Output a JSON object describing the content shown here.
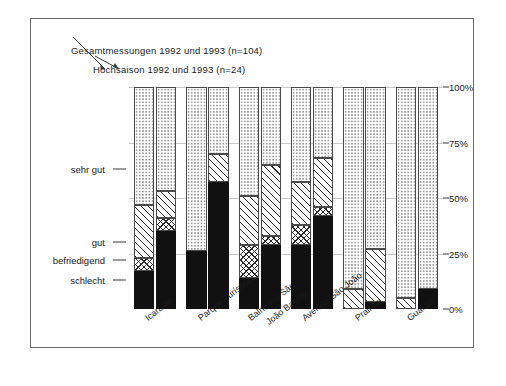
{
  "legend": {
    "total": "Gesamtmessungen 1992 und 1993 (n=104)",
    "high_season": "Hochsaison 1992 und 1993 (n=24)"
  },
  "left_keys": [
    {
      "label": "sehr gut",
      "pct": 63
    },
    {
      "label": "gut",
      "pct": 30
    },
    {
      "label": "befriedigend",
      "pct": 22
    },
    {
      "label": "schlecht",
      "pct": 13
    }
  ],
  "right_axis": [
    "0%",
    "25%",
    "50%",
    "75%",
    "100%"
  ],
  "chart_data": {
    "type": "bar",
    "title": "",
    "xlabel": "",
    "ylabel": "",
    "ylim": [
      0,
      100
    ],
    "grid": true,
    "stacked": true,
    "grouped": true,
    "legend_position": "top-left",
    "categories": [
      "Icaraíba",
      "Parque Turístico",
      "Balneário São João Batista",
      "Avenida São João",
      "Prainha",
      "Guaraú"
    ],
    "groups": [
      "Gesamtmessungen 1992 und 1993 (n=104)",
      "Hochsaison 1992 und 1993 (n=24)"
    ],
    "stack_order": [
      "schlecht",
      "befriedigend",
      "gut",
      "sehr gut"
    ],
    "series": [
      {
        "name": "schlecht",
        "pattern": "solid-black",
        "values_total": [
          17,
          26,
          14,
          29,
          0,
          0
        ],
        "values_high": [
          35,
          57,
          29,
          42,
          3,
          9
        ]
      },
      {
        "name": "befriedigend",
        "pattern": "cross-hatch",
        "values_total": [
          6,
          0,
          15,
          9,
          0,
          0
        ],
        "values_high": [
          6,
          0,
          4,
          4,
          0,
          0
        ]
      },
      {
        "name": "gut",
        "pattern": "diagonal-hatch",
        "values_total": [
          24,
          0,
          22,
          19,
          9,
          5
        ],
        "values_high": [
          12,
          13,
          32,
          22,
          24,
          0
        ]
      },
      {
        "name": "sehr gut",
        "pattern": "fine-dots",
        "values_total": [
          53,
          74,
          49,
          43,
          91,
          95
        ],
        "values_high": [
          47,
          30,
          35,
          32,
          73,
          91
        ]
      }
    ]
  }
}
